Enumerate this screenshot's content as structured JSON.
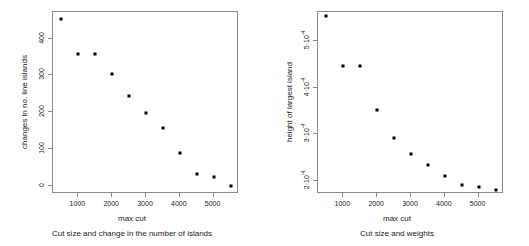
{
  "figure": {
    "background_color": "#ffffff",
    "point_color": "#000000",
    "axis_color": "#8a8a8a",
    "text_color": "#1a1a1a"
  },
  "chart_data": [
    {
      "type": "scatter",
      "panel": "left",
      "title": "",
      "caption": "Cut size and change in the number of islands",
      "xlabel": "max cut",
      "ylabel": "changes in no. line islands",
      "grid": false,
      "legend": "none",
      "xlim": [
        250,
        5750
      ],
      "ylim": [
        -22,
        472
      ],
      "xticks": [
        1000,
        2000,
        3000,
        4000,
        5000
      ],
      "xtick_labels": [
        "1000",
        "2000",
        "3000",
        "4000",
        "5000"
      ],
      "yticks": [
        0,
        100,
        200,
        300,
        400
      ],
      "ytick_labels": [
        "0",
        "100",
        "200",
        "300",
        "400"
      ],
      "x": [
        500,
        1000,
        1500,
        2000,
        2500,
        3000,
        3500,
        4000,
        4500,
        5000,
        5500
      ],
      "y": [
        452,
        358,
        358,
        303,
        244,
        199,
        158,
        89,
        31,
        25,
        1
      ]
    },
    {
      "type": "scatter",
      "panel": "right",
      "title": "",
      "caption": "Cut size and weights",
      "xlabel": "max cut",
      "ylabel": "height of largest island",
      "grid": false,
      "legend": "none",
      "xlim": [
        250,
        5750
      ],
      "ylim": [
        0.000172,
        0.000562
      ],
      "xticks": [
        1000,
        2000,
        3000,
        4000,
        5000
      ],
      "xtick_labels": [
        "1000",
        "2000",
        "3000",
        "4000",
        "5000"
      ],
      "yticks": [
        0.0002,
        0.0003,
        0.0004,
        0.0005
      ],
      "ytick_labels": [
        {
          "mantissa": "2·10",
          "exponent": "-4"
        },
        {
          "mantissa": "3·10",
          "exponent": "-4"
        },
        {
          "mantissa": "4·10",
          "exponent": "-4"
        },
        {
          "mantissa": "5·10",
          "exponent": "-4"
        }
      ],
      "x": [
        500,
        1000,
        1500,
        2000,
        2500,
        3000,
        3500,
        4000,
        4500,
        5000,
        5500
      ],
      "y": [
        0.000553,
        0.000447,
        0.000447,
        0.000352,
        0.000292,
        0.000257,
        0.000235,
        0.000211,
        0.000191,
        0.000188,
        0.000181
      ]
    }
  ]
}
